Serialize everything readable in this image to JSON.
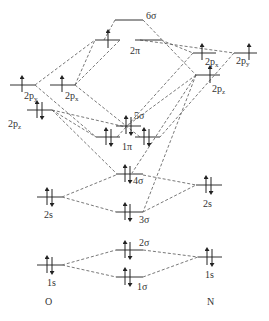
{
  "diagram": {
    "atoms": {
      "left": "O",
      "right": "N"
    },
    "oxygen_aos": [
      {
        "id": "O_1s",
        "label": "1s",
        "electrons": 2
      },
      {
        "id": "O_2s",
        "label": "2s",
        "electrons": 2
      },
      {
        "id": "O_2pz",
        "label": "2p",
        "sub": "z",
        "electrons": 2
      },
      {
        "id": "O_2py",
        "label": "2p",
        "sub": "y",
        "electrons": 1
      },
      {
        "id": "O_2px",
        "label": "2p",
        "sub": "x",
        "electrons": 1
      }
    ],
    "nitrogen_aos": [
      {
        "id": "N_1s",
        "label": "1s",
        "electrons": 2
      },
      {
        "id": "N_2s",
        "label": "2s",
        "electrons": 2
      },
      {
        "id": "N_2pz",
        "label": "2p",
        "sub": "z",
        "electrons": 1
      },
      {
        "id": "N_2px",
        "label": "2p",
        "sub": "x",
        "electrons": 1
      },
      {
        "id": "N_2py",
        "label": "2p",
        "sub": "y",
        "electrons": 1
      }
    ],
    "mos": [
      {
        "id": "1sigma",
        "label": "1σ",
        "electrons": 2
      },
      {
        "id": "2sigma",
        "label": "2σ",
        "electrons": 2
      },
      {
        "id": "3sigma",
        "label": "3σ",
        "electrons": 2
      },
      {
        "id": "4sigma",
        "label": "4σ",
        "electrons": 2
      },
      {
        "id": "1pi",
        "label": "1π",
        "electrons": 4
      },
      {
        "id": "5sigma",
        "label": "5σ",
        "electrons": 2
      },
      {
        "id": "2pi",
        "label": "2π",
        "electrons": 1
      },
      {
        "id": "6sigma",
        "label": "6σ",
        "electrons": 0
      }
    ]
  }
}
